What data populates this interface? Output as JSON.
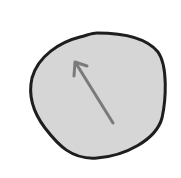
{
  "diagram": {
    "shape": {
      "type": "irregular-blob",
      "fill": "#d6d6d6",
      "stroke": "#1e1e1e",
      "stroke_width": 3
    },
    "arrow": {
      "color": "#7a7a7a",
      "from": [
        113,
        123
      ],
      "to": [
        75,
        62
      ],
      "stroke_width": 3
    },
    "background": "#ffffff"
  }
}
